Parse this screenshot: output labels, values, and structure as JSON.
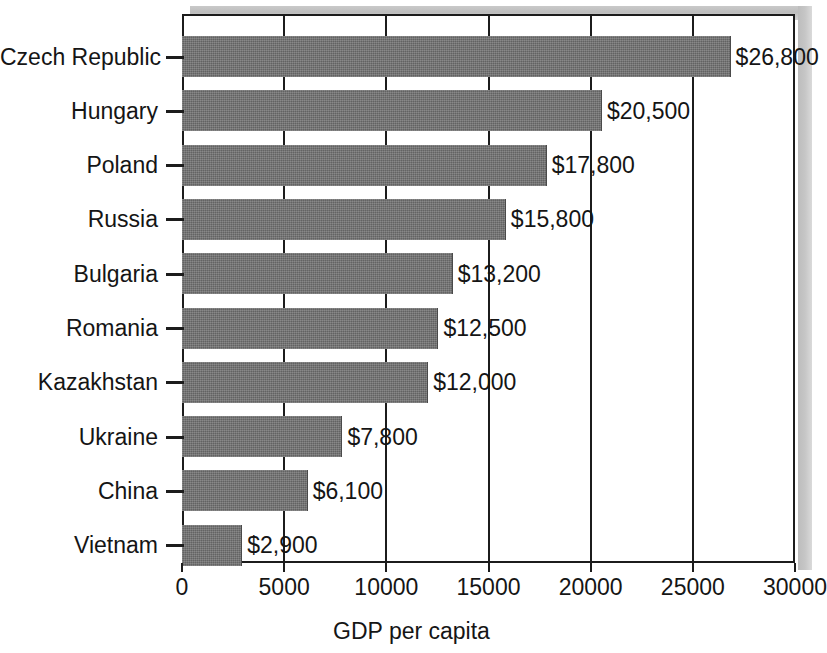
{
  "chart_data": {
    "type": "bar",
    "orientation": "horizontal",
    "title": "",
    "xlabel": "GDP per capita",
    "ylabel": "",
    "xlim": [
      0,
      30000
    ],
    "xticks": [
      0,
      5000,
      10000,
      15000,
      20000,
      25000,
      30000
    ],
    "xtick_labels": [
      "0",
      "5000",
      "10000",
      "15000",
      "20000",
      "25000",
      "30000"
    ],
    "grid": true,
    "grid_axis": "x",
    "legend": false,
    "bar_color": "#6e6e6e",
    "axis_color": "#1c1c1c",
    "categories": [
      "Czech Republic",
      "Hungary",
      "Poland",
      "Russia",
      "Bulgaria",
      "Romania",
      "Kazakhstan",
      "Ukraine",
      "China",
      "Vietnam"
    ],
    "values": [
      26800,
      20500,
      17800,
      15800,
      13200,
      12500,
      12000,
      7800,
      6100,
      2900
    ],
    "value_labels": [
      "$26,800",
      "$20,500",
      "$17,800",
      "$15,800",
      "$13,200",
      "$12,500",
      "$12,000",
      "$7,800",
      "$6,100",
      "$2,900"
    ]
  }
}
